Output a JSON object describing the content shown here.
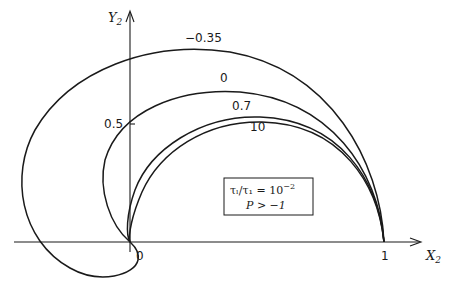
{
  "axes": {
    "x_label": "X",
    "x_label_sub": "2",
    "y_label": "Y",
    "y_label_sub": "2",
    "x_ticks": [
      {
        "value": 0,
        "label": "0"
      },
      {
        "value": 1,
        "label": "1"
      }
    ],
    "y_ticks": [
      {
        "value": 0.5,
        "label": "0.5"
      }
    ]
  },
  "curves": [
    {
      "label": "−0.35"
    },
    {
      "label": "0"
    },
    {
      "label": "0.7"
    },
    {
      "label": "10"
    }
  ],
  "legend_box": {
    "line1_lhs": "τₗ/τ₁ = 10",
    "line1_exp": "−2",
    "line2": "P > −1"
  }
}
